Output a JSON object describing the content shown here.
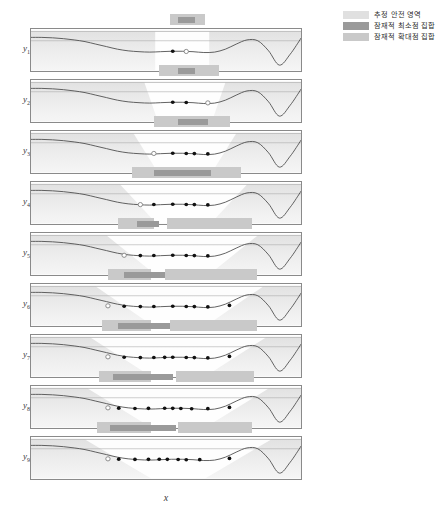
{
  "figure": {
    "xlabel": "x",
    "ylabel_base": "y",
    "n_panels": 9
  },
  "legend": {
    "position": "top-right",
    "items": [
      {
        "label": "추정 안전 영역",
        "color": "#e0e0e0"
      },
      {
        "label": "잠재적 최소점 집합",
        "color": "#9a9a9a"
      },
      {
        "label": "잠재적 확대점 집합",
        "color": "#c9c9c9"
      }
    ]
  },
  "panels": [
    {
      "ylabel": "y",
      "sub": "1"
    },
    {
      "ylabel": "y",
      "sub": "2"
    },
    {
      "ylabel": "y",
      "sub": "3"
    },
    {
      "ylabel": "y",
      "sub": "4"
    },
    {
      "ylabel": "y",
      "sub": "5"
    },
    {
      "ylabel": "y",
      "sub": "6"
    },
    {
      "ylabel": "y",
      "sub": "7"
    },
    {
      "ylabel": "y",
      "sub": "8"
    },
    {
      "ylabel": "y",
      "sub": "9"
    }
  ],
  "chart_data": {
    "type": "line",
    "title": "",
    "xlabel": "x",
    "ylabel": "y",
    "xlim": [
      0,
      1
    ],
    "ylim": [
      0,
      1
    ],
    "grid": false,
    "legend_position": "top-right",
    "threshold_y": 0.72,
    "curve_x": [
      0.0,
      0.04,
      0.08,
      0.12,
      0.16,
      0.2,
      0.24,
      0.28,
      0.32,
      0.36,
      0.4,
      0.44,
      0.48,
      0.52,
      0.56,
      0.6,
      0.64,
      0.68,
      0.72,
      0.76,
      0.8,
      0.84,
      0.88,
      0.92,
      0.96,
      1.0
    ],
    "curve_y": [
      0.8,
      0.8,
      0.79,
      0.77,
      0.74,
      0.7,
      0.64,
      0.58,
      0.52,
      0.48,
      0.46,
      0.45,
      0.46,
      0.47,
      0.47,
      0.46,
      0.44,
      0.45,
      0.52,
      0.64,
      0.74,
      0.72,
      0.48,
      0.14,
      0.4,
      0.78
    ],
    "series": [
      {
        "name": "panel-1",
        "observations_x": [
          0.525
        ],
        "observations_y": [
          0.47
        ],
        "incumbent_x": 0.575,
        "incumbent_y": 0.465,
        "safe_region": [
          0.46,
          0.66
        ],
        "min_bars": [
          [
            0.545,
            0.605
          ]
        ],
        "max_bars": [
          [
            0.515,
            0.645
          ]
        ]
      },
      {
        "name": "panel-2",
        "observations_x": [
          0.525,
          0.575
        ],
        "observations_y": [
          0.47,
          0.465
        ],
        "incumbent_x": 0.655,
        "incumbent_y": 0.455,
        "safe_region": [
          0.42,
          0.72
        ],
        "min_bars": [
          [
            0.545,
            0.605
          ]
        ],
        "max_bars": [
          [
            0.475,
            0.695
          ]
        ]
      },
      {
        "name": "panel-3",
        "observations_x": [
          0.525,
          0.575,
          0.605,
          0.655
        ],
        "observations_y": [
          0.47,
          0.465,
          0.462,
          0.455
        ],
        "incumbent_x": 0.455,
        "incumbent_y": 0.465,
        "safe_region": [
          0.38,
          0.76
        ],
        "min_bars": [
          [
            0.545,
            0.655
          ]
        ],
        "max_bars": [
          [
            0.455,
            0.735
          ]
        ]
      },
      {
        "name": "panel-4",
        "observations_x": [
          0.455,
          0.525,
          0.575,
          0.605,
          0.655
        ],
        "observations_y": [
          0.465,
          0.47,
          0.465,
          0.462,
          0.455
        ],
        "incumbent_x": 0.405,
        "incumbent_y": 0.462,
        "safe_region": [
          0.33,
          0.8
        ],
        "min_bars": [
          [
            0.455,
            0.665
          ]
        ],
        "max_bars": [
          [
            0.375,
            0.775
          ]
        ]
      },
      {
        "name": "panel-5",
        "observations_x": [
          0.405,
          0.455,
          0.525,
          0.575,
          0.605,
          0.655
        ],
        "observations_y": [
          0.462,
          0.465,
          0.47,
          0.465,
          0.462,
          0.455
        ],
        "incumbent_x": 0.345,
        "incumbent_y": 0.47,
        "safe_region": [
          0.28,
          0.84
        ],
        "min_bars": [
          [
            0.395,
            0.475
          ]
        ],
        "max_bars": [
          [
            0.325,
            0.455
          ],
          [
            0.505,
            0.815
          ]
        ]
      },
      {
        "name": "panel-6",
        "observations_x": [
          0.345,
          0.405,
          0.455,
          0.525,
          0.575,
          0.605,
          0.655,
          0.735
        ],
        "observations_y": [
          0.47,
          0.462,
          0.465,
          0.47,
          0.465,
          0.462,
          0.455,
          0.49
        ],
        "incumbent_x": 0.285,
        "incumbent_y": 0.48,
        "safe_region": [
          0.24,
          0.86
        ],
        "min_bars": [
          [
            0.345,
            0.495
          ]
        ],
        "max_bars": [
          [
            0.285,
            0.445
          ],
          [
            0.495,
            0.835
          ]
        ]
      },
      {
        "name": "panel-7",
        "observations_x": [
          0.345,
          0.405,
          0.455,
          0.495,
          0.525,
          0.575,
          0.605,
          0.655,
          0.735
        ],
        "observations_y": [
          0.47,
          0.462,
          0.465,
          0.468,
          0.47,
          0.465,
          0.462,
          0.455,
          0.49
        ],
        "incumbent_x": 0.285,
        "incumbent_y": 0.48,
        "safe_region": [
          0.22,
          0.87
        ],
        "min_bars": [
          [
            0.325,
            0.515
          ]
        ],
        "max_bars": [
          [
            0.265,
            0.445
          ],
          [
            0.515,
            0.835
          ]
        ]
      },
      {
        "name": "panel-8",
        "observations_x": [
          0.325,
          0.385,
          0.435,
          0.495,
          0.525,
          0.555,
          0.595,
          0.655,
          0.735
        ],
        "observations_y": [
          0.472,
          0.465,
          0.468,
          0.47,
          0.468,
          0.463,
          0.458,
          0.46,
          0.49
        ],
        "incumbent_x": 0.285,
        "incumbent_y": 0.48,
        "safe_region": [
          0.21,
          0.88
        ],
        "min_bars": [
          [
            0.305,
            0.525
          ]
        ],
        "max_bars": [
          [
            0.255,
            0.445
          ],
          [
            0.535,
            0.825
          ]
        ]
      },
      {
        "name": "panel-9",
        "observations_x": [
          0.325,
          0.385,
          0.435,
          0.475,
          0.505,
          0.545,
          0.575,
          0.625,
          0.735
        ],
        "observations_y": [
          0.472,
          0.466,
          0.468,
          0.47,
          0.468,
          0.463,
          0.458,
          0.46,
          0.49
        ],
        "incumbent_x": 0.285,
        "incumbent_y": 0.48,
        "safe_region": [
          0.2,
          0.89
        ],
        "min_bars": [
          [
            0.295,
            0.535
          ]
        ],
        "max_bars": [
          [
            0.245,
            0.445
          ],
          [
            0.545,
            0.815
          ]
        ]
      }
    ]
  }
}
